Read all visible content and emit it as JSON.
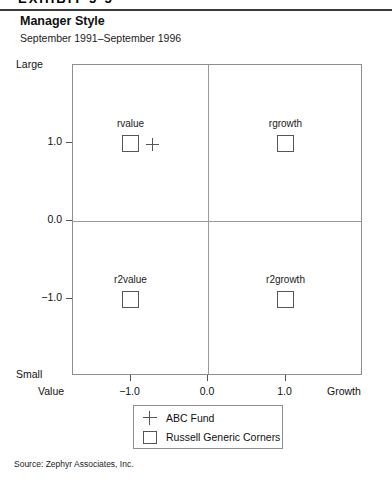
{
  "header": {
    "exhibit_label": "EXHIBIT 5-5",
    "title": "Manager Style",
    "subtitle": "September 1991–September 1996"
  },
  "source": {
    "text": "Source: Zephyr Associates, Inc."
  },
  "legend": {
    "items": [
      {
        "label": "ABC Fund",
        "marker": "plus-marker"
      },
      {
        "label": "Russell Generic Corners",
        "marker": "square-marker"
      }
    ]
  },
  "colors": {
    "frame": "#8e8e8e",
    "grid": "#9a9a9a",
    "marker": "#555555",
    "text": "#111111",
    "rule": "#3a3a3a"
  },
  "chart_data": {
    "type": "scatter",
    "title": "Manager Style",
    "subtitle": "September 1991–September 1996",
    "xlabel": "",
    "ylabel": "",
    "xlim": [
      -1.875,
      2.0
    ],
    "ylim": [
      -2.0,
      2.0
    ],
    "grid": true,
    "grid_lines": {
      "x": [
        0.0
      ],
      "y": [
        0.0
      ]
    },
    "legend_position": "below-axes",
    "x_ticks": [
      -1.0,
      0.0,
      1.0
    ],
    "x_tick_labels": [
      "−1.0",
      "0.0",
      "1.0"
    ],
    "y_ticks": [
      1.0,
      0.0,
      -1.0
    ],
    "y_tick_labels": [
      "1.0",
      "0.0",
      "−1.0"
    ],
    "x_axis_end_labels": {
      "low": "Value",
      "high": "Growth"
    },
    "y_axis_end_labels": {
      "low": "Small",
      "high": "Large"
    },
    "series": [
      {
        "name": "Russell Generic Corners",
        "marker": "square",
        "points": [
          {
            "label": "rvalue",
            "x": -1.0,
            "y": 1.0
          },
          {
            "label": "rgrowth",
            "x": 1.0,
            "y": 1.0
          },
          {
            "label": "r2value",
            "x": -1.0,
            "y": -1.0
          },
          {
            "label": "r2growth",
            "x": 1.0,
            "y": -1.0
          }
        ]
      },
      {
        "name": "ABC Fund",
        "marker": "plus",
        "points": [
          {
            "label": "ABC Fund",
            "x": -0.72,
            "y": 0.98
          }
        ]
      }
    ]
  }
}
